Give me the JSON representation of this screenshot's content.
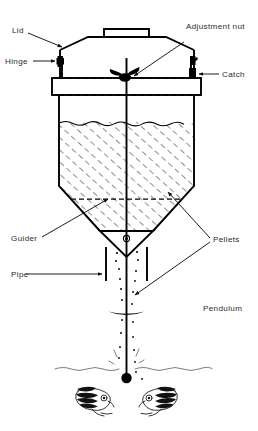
{
  "figure": {
    "background_color": "#ffffff",
    "ink_color": "#000000",
    "label_color": "#2b2b2b",
    "water_color": "#6d6d6d"
  },
  "labels": {
    "lid": "Lid",
    "hinge": "Hinge",
    "adjustment_nut": "Adjustment nut",
    "catch": "Catch",
    "guider": "Guider",
    "pipe": "Pipe",
    "pellets": "Pellets",
    "pendulum": "Pendulum"
  },
  "parts": {
    "lid_handle": "lid-handle",
    "hopper_body": "hopper-body",
    "collar_band": "collar-band",
    "pellet_fill": "pellet-fill-hatching",
    "guider_cone": "guider-cone",
    "guider_hole": "guider-orifice",
    "delivery_pipe": "delivery-pipe",
    "pendulum_rod": "pendulum-rod",
    "pendulum_disc": "pendulum-disc",
    "pendulum_ball": "pendulum-ball",
    "water_surface": "water-surface-line",
    "fish_left": "fish-left",
    "fish_right": "fish-right",
    "falling_pellets": "falling-pellet-stream"
  },
  "geometry": {
    "canvas_width": 258,
    "canvas_height": 431,
    "hopper_top_y": 36,
    "hopper_left_x": 57,
    "hopper_right_x": 196,
    "fill_level_y": 122,
    "cone_start_y": 186,
    "guider_y": 232,
    "pipe_bottom_y": 280,
    "pendulum_disc_y": 313,
    "water_line_y": 368,
    "ball_y": 378
  }
}
